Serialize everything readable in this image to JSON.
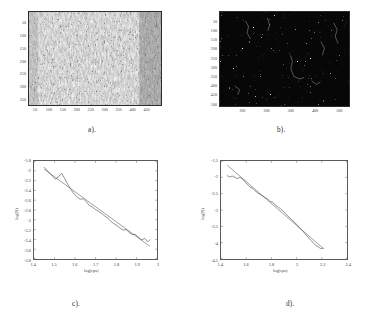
{
  "figure": {
    "panels": [
      {
        "id": "a",
        "caption": "a).",
        "type": "grayscale-image",
        "description": "speckled grayscale texture image",
        "x_ticks": [
          "50",
          "100",
          "150",
          "200",
          "250",
          "300",
          "350",
          "400",
          "450"
        ],
        "y_ticks": [
          "50",
          "100",
          "150",
          "200",
          "250",
          "300",
          "350"
        ],
        "x_range": [
          0,
          480
        ],
        "y_range": [
          0,
          370
        ],
        "background": "#ffffff"
      },
      {
        "id": "b",
        "caption": "b).",
        "type": "binary-edge-image",
        "description": "dark edge-detected image with bright filament speckles",
        "x_ticks": [
          "100",
          "200",
          "300",
          "400",
          "500"
        ],
        "y_ticks": [
          "50",
          "100",
          "150",
          "200",
          "250",
          "300",
          "350",
          "400",
          "450",
          "500"
        ],
        "x_range": [
          0,
          540
        ],
        "y_range": [
          0,
          520
        ],
        "background": "#080808"
      }
    ],
    "captions": {
      "a": "a).",
      "b": "b).",
      "c": "c).",
      "d": "d)."
    }
  },
  "chart_data": [
    {
      "id": "c",
      "type": "line",
      "title": "",
      "xlabel": "log(eps)",
      "ylabel": "log(N)",
      "xlim": [
        1.4,
        2.0
      ],
      "ylim": [
        -3.8,
        -1.8
      ],
      "xticks": [
        "1.4",
        "1.5",
        "1.6",
        "1.7",
        "1.8",
        "1.9",
        "2"
      ],
      "yticks": [
        "-1.8",
        "-2",
        "-2.2",
        "-2.4",
        "-2.6",
        "-2.8",
        "-3",
        "-3.2",
        "-3.4",
        "-3.6",
        "-3.8"
      ],
      "grid": false,
      "legend": "none",
      "series": [
        {
          "name": "box-counting curve",
          "style": "staircase",
          "x": [
            1.45,
            1.47,
            1.49,
            1.505,
            1.52,
            1.535,
            1.55,
            1.565,
            1.58,
            1.595,
            1.61,
            1.625,
            1.64,
            1.655,
            1.67,
            1.685,
            1.7,
            1.715,
            1.73,
            1.745,
            1.76,
            1.775,
            1.79,
            1.805,
            1.82,
            1.835,
            1.85,
            1.865,
            1.88,
            1.895,
            1.91,
            1.925,
            1.94,
            1.955,
            1.965
          ],
          "y": [
            -1.93,
            -2.02,
            -2.11,
            -2.17,
            -2.12,
            -2.05,
            -2.16,
            -2.28,
            -2.38,
            -2.47,
            -2.53,
            -2.58,
            -2.57,
            -2.63,
            -2.71,
            -2.74,
            -2.79,
            -2.83,
            -2.87,
            -2.92,
            -2.97,
            -3.03,
            -3.08,
            -3.12,
            -3.17,
            -3.21,
            -3.2,
            -3.26,
            -3.3,
            -3.3,
            -3.36,
            -3.41,
            -3.38,
            -3.45,
            -3.41
          ]
        },
        {
          "name": "linear regression fit",
          "style": "straight",
          "x": [
            1.45,
            1.965
          ],
          "y": [
            -1.97,
            -3.54
          ]
        }
      ]
    },
    {
      "id": "d",
      "type": "line",
      "title": "",
      "xlabel": "log(eps)",
      "ylabel": "log(N)",
      "xlim": [
        1.4,
        2.4
      ],
      "ylim": [
        -4.5,
        -1.5
      ],
      "xticks": [
        "1.4",
        "1.6",
        "1.8",
        "2",
        "2.2",
        "2.4"
      ],
      "yticks": [
        "-1.5",
        "-2",
        "-2.5",
        "-3",
        "-3.5",
        "-4",
        "-4.5"
      ],
      "grid": false,
      "legend": "none",
      "series": [
        {
          "name": "box-counting curve",
          "style": "staircase",
          "x": [
            1.45,
            1.47,
            1.49,
            1.51,
            1.53,
            1.55,
            1.57,
            1.59,
            1.61,
            1.63,
            1.65,
            1.67,
            1.69,
            1.71,
            1.73,
            1.75,
            1.77,
            1.79,
            1.81,
            1.83,
            1.85,
            1.87,
            1.89,
            1.91,
            1.93,
            1.95,
            1.97,
            1.99,
            2.01,
            2.03,
            2.05,
            2.07,
            2.09,
            2.11,
            2.13,
            2.15,
            2.17,
            2.19,
            2.21
          ],
          "y": [
            -1.95,
            -1.99,
            -1.96,
            -2.0,
            -2.04,
            -2.0,
            -2.05,
            -2.13,
            -2.22,
            -2.3,
            -2.33,
            -2.41,
            -2.48,
            -2.52,
            -2.57,
            -2.62,
            -2.66,
            -2.74,
            -2.76,
            -2.85,
            -2.9,
            -2.96,
            -3.02,
            -3.1,
            -3.18,
            -3.25,
            -3.33,
            -3.4,
            -3.48,
            -3.57,
            -3.65,
            -3.74,
            -3.83,
            -3.92,
            -3.99,
            -4.08,
            -4.12,
            -4.18,
            -4.17
          ]
        },
        {
          "name": "linear regression fit",
          "style": "straight",
          "x": [
            1.45,
            2.215
          ],
          "y": [
            -1.63,
            -4.19
          ]
        }
      ]
    }
  ]
}
